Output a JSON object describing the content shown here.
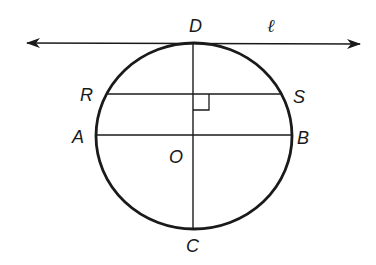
{
  "diagram": {
    "type": "geometry",
    "labels": {
      "D": "D",
      "ell": "ℓ",
      "R": "R",
      "S": "S",
      "A": "A",
      "B": "B",
      "O": "O",
      "C": "C"
    },
    "circle": {
      "cx": 194,
      "cy": 136,
      "rx": 98,
      "ry": 93,
      "stroke": "#1a1a1a"
    },
    "tangent_line": {
      "x1": 27,
      "y1": 43,
      "x2": 360,
      "y2": 44,
      "name": "ℓ"
    },
    "diameter_AB": {
      "x1": 96,
      "y1": 135,
      "x2": 292,
      "y2": 135
    },
    "diameter_CD": {
      "x1": 193,
      "y1": 43,
      "x2": 193,
      "y2": 229
    },
    "chord_RS": {
      "x1": 108,
      "y1": 94,
      "x2": 281,
      "y2": 94
    },
    "right_angle_marker": {
      "x": 193,
      "y": 94,
      "size": 16
    },
    "colors": {
      "stroke": "#1a1a1a",
      "background": "#ffffff"
    }
  }
}
